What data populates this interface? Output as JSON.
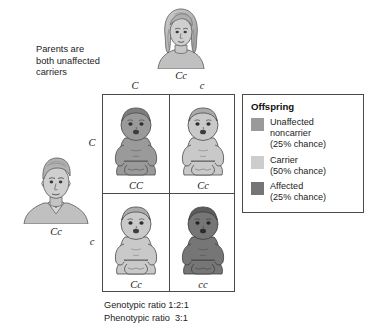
{
  "diagram": {
    "parents_caption": "Parents are\nboth unaffected\ncarriers",
    "mother": {
      "figure_name": "mother-illustration",
      "genotype": "Cc"
    },
    "father": {
      "figure_name": "father-illustration",
      "genotype": "Cc"
    },
    "punnett": {
      "column_alleles": [
        "C",
        "c"
      ],
      "row_alleles": [
        "C",
        "c"
      ],
      "cells": [
        {
          "genotype": "CC",
          "phenotype": "Unaffected noncarrier",
          "shade": "#9a9a9a",
          "baby_name": "baby-unaffected-noncarrier"
        },
        {
          "genotype": "Cc",
          "phenotype": "Carrier",
          "shade": "#c9c9c9",
          "baby_name": "baby-carrier-1"
        },
        {
          "genotype": "Cc",
          "phenotype": "Carrier",
          "shade": "#c9c9c9",
          "baby_name": "baby-carrier-2"
        },
        {
          "genotype": "cc",
          "phenotype": "Affected",
          "shade": "#767676",
          "baby_name": "baby-affected"
        }
      ]
    },
    "legend": {
      "title": "Offspring",
      "items": [
        {
          "label": "Unaffected\nnoncarrier\n(25% chance)",
          "color": "#9a9a9a",
          "chance": "25%"
        },
        {
          "label": "Carrier\n(50% chance)",
          "color": "#cdcdcd",
          "chance": "50%"
        },
        {
          "label": "Affected\n(25% chance)",
          "color": "#757575",
          "chance": "25%"
        }
      ]
    },
    "ratios": {
      "genotypic": "Genotypic ratio 1:2:1",
      "phenotypic": "Phenotypic ratio  3:1"
    },
    "colors": {
      "line": "#4a4a4a",
      "text": "#222222",
      "background": "#ffffff",
      "skin_unaffected": "#9a9a9a",
      "skin_carrier": "#c9c9c9",
      "skin_affected": "#767676"
    }
  }
}
